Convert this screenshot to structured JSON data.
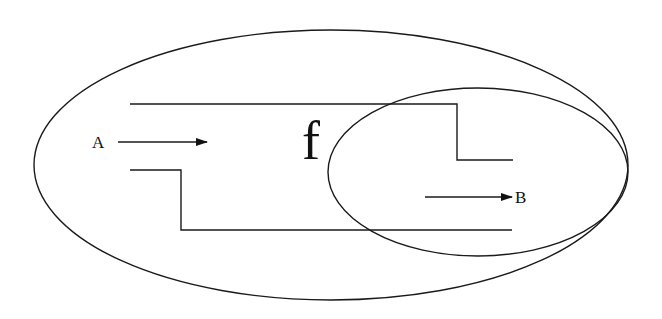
{
  "diagram": {
    "outer_region": {
      "shape": "ellipse",
      "cx": 331,
      "cy": 165,
      "rx": 297,
      "ry": 135
    },
    "inner_region": {
      "shape": "ellipse",
      "cx": 478,
      "cy": 172,
      "rx": 150,
      "ry": 84
    },
    "channel": {
      "upper_wall": "130,104 457,104 457,160 513,160",
      "lower_wall": "130,170 181,170 181,230 512,230"
    },
    "labels": {
      "input": "A",
      "output": "B",
      "function": "f"
    },
    "arrows": {
      "input_arrow": {
        "x1": 118,
        "y1": 142,
        "x2": 207,
        "y2": 142
      },
      "output_arrow": {
        "x1": 425,
        "y1": 197,
        "x2": 512,
        "y2": 197
      }
    },
    "colors": {
      "line": "#1a1a1a",
      "background": "#ffffff"
    }
  }
}
